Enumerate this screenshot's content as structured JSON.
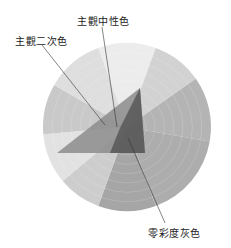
{
  "diagram": {
    "type": "color-wheel-gamut",
    "labels": {
      "subjective_secondary": "主觀二次色",
      "subjective_neutral": "主觀中性色",
      "zero_chroma_gray": "零彩度灰色"
    },
    "wheel_sectors": [
      {
        "name": "sector-top",
        "fill": "#ececec"
      },
      {
        "name": "sector-top-right",
        "fill": "#d2d2d2"
      },
      {
        "name": "sector-right-upper",
        "fill": "#b4b4b4"
      },
      {
        "name": "sector-right-lower",
        "fill": "#adadad"
      },
      {
        "name": "sector-bottom",
        "fill": "#a6a6a6"
      },
      {
        "name": "sector-bottom-left",
        "fill": "#cdcdcd"
      },
      {
        "name": "sector-left-lower",
        "fill": "#e2e2e2"
      },
      {
        "name": "sector-left",
        "fill": "#c9c9c9"
      },
      {
        "name": "sector-top-left",
        "fill": "#dedede"
      }
    ],
    "gamut_triangle": {
      "fill_outer": "#8a8a8a",
      "fill_inner": "#555555"
    }
  }
}
